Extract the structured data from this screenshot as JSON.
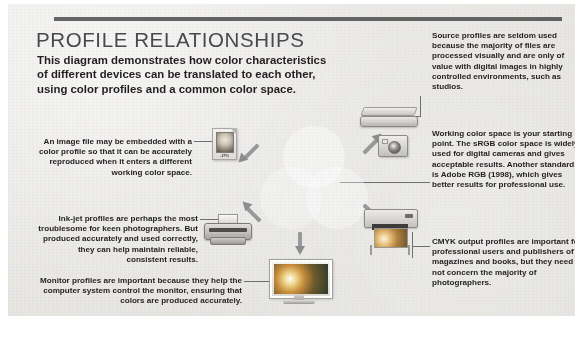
{
  "document": {
    "title": "PROFILE RELATIONSHIPS",
    "subtitle": "This diagram demonstrates how color characteristics of different devices can be translated to each other, using color profiles and a common color space."
  },
  "captions": {
    "source_profiles": "Source profiles are seldom used because the majority of files are processed visually and are only of value with digital images in highly controlled environments, such as studios.",
    "working_color_space": "Working color space is your starting point. The sRGB color space is widely used for digital cameras and gives acceptable results. Another standard is Adobe RGB (1998), which gives better results for professional use.",
    "cmyk_output": "CMYK output profiles are important for professional users and publishers of magazines and books, but they need not concern the majority of photographers.",
    "image_file": "An image file may be embedded with a color profile so that it can be accurately reproduced when it enters a different working color space.",
    "inkjet": "Ink-jet profiles are perhaps the most troublesome for keen photographers. But produced accurately and used correctly, they can help maintain reliable, consistent results.",
    "monitor": "Monitor profiles are important because they help the computer system control the monitor, ensuring that colors are produced accurately."
  },
  "icons": {
    "image_file_label": ".JPG",
    "names": {
      "image_file": "image-file-icon",
      "scanner": "scanner-icon",
      "camera": "camera-icon",
      "printer": "inkjet-printer-icon",
      "press": "cmyk-press-icon",
      "monitor": "monitor-icon",
      "venn": "color-space-venn-diagram"
    }
  },
  "colors": {
    "panel_background": "#e9e8e6",
    "page_background": "#ffffff",
    "rule": "#58585a",
    "title_text": "#4a4a4c",
    "body_text": "#231f20",
    "venn_top": "#6f6f71",
    "venn_left": "#4a4a4c",
    "venn_right": "#5c5c5e",
    "arrow": "#9a9a9c",
    "leader_line": "#6f6f71"
  }
}
